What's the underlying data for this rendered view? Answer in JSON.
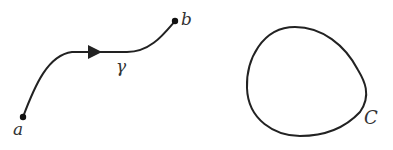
{
  "figure": {
    "open_curve": {
      "name": "γ",
      "start_label": "a",
      "end_label": "b",
      "curve_label": "γ",
      "direction": "a to b"
    },
    "closed_curve": {
      "label": "C",
      "orientation": "counterclockwise"
    },
    "colors": {
      "stroke": "#222222",
      "label": "#333333",
      "background": "#ffffff"
    }
  }
}
